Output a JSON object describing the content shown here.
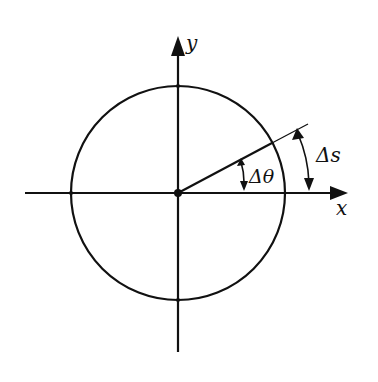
{
  "diagram": {
    "title": "",
    "axes": {
      "x_label": "x",
      "y_label": "y"
    },
    "annotations": {
      "angle_label": "Δθ",
      "arc_label": "Δs"
    },
    "geometry": {
      "center": [
        178,
        193
      ],
      "radius": 107,
      "angle_deg": 28
    },
    "colors": {
      "stroke": "#111111",
      "background": "#ffffff"
    }
  }
}
